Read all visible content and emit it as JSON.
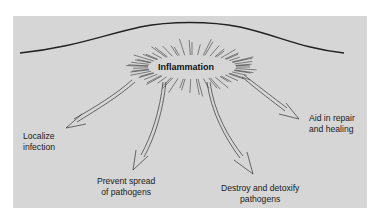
{
  "diagram": {
    "center_label": "Inflammation",
    "outcomes": [
      {
        "id": "localize",
        "lines": [
          "Localize",
          "infection"
        ]
      },
      {
        "id": "prevent",
        "lines": [
          "Prevent spread",
          "of pathogens"
        ]
      },
      {
        "id": "destroy",
        "lines": [
          "Destroy and detoxify",
          "pathogens"
        ]
      },
      {
        "id": "aid",
        "lines": [
          "Aid in repair",
          "and healing"
        ]
      }
    ]
  },
  "colors": {
    "panel": "#d6d6d6",
    "line": "#2a2a2a",
    "text": "#1a1a1a"
  }
}
